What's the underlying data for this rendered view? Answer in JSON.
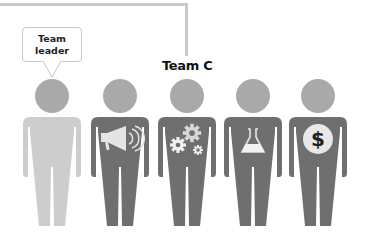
{
  "diagram": {
    "team_label": "Team C",
    "leader_bubble": "Team\nleader",
    "colors": {
      "connector": "#c9c9c9",
      "head": "#a9a9a9",
      "leader_body": "#cdcdcd",
      "member_body": "#6f6f6f",
      "icon_light": "#e8e8e8",
      "dollar_glyph": "#222222"
    },
    "figures": [
      {
        "role": "Team leader",
        "icon": "none",
        "highlight": true
      },
      {
        "role": "Marketing",
        "icon": "megaphone-icon"
      },
      {
        "role": "Engineering",
        "icon": "gears-icon"
      },
      {
        "role": "Science / R&D",
        "icon": "flask-icon"
      },
      {
        "role": "Finance",
        "icon": "dollar-icon",
        "glyph": "$"
      }
    ]
  }
}
